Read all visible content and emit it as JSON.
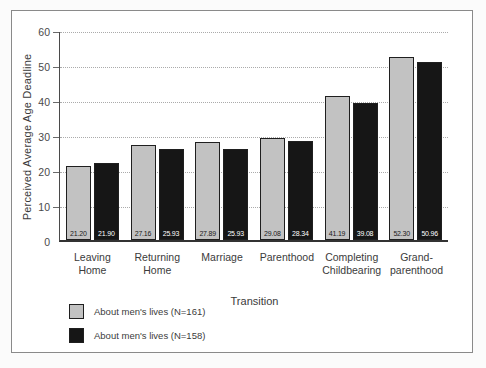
{
  "figure": {
    "background": "#ffffff",
    "outer_background": "#fbfbfb",
    "frame_border_color": "#8a8a8a"
  },
  "chart_data": {
    "type": "bar",
    "title": "",
    "xlabel": "Transition",
    "ylabel": "Perceived Average Age Deadline",
    "ylim": [
      0,
      60
    ],
    "yticks": [
      0,
      10,
      20,
      30,
      40,
      50,
      60
    ],
    "grid": "horizontal-dotted",
    "legend_position": "bottom-left",
    "categories": [
      "Leaving\nHome",
      "Returning\nHome",
      "Marriage",
      "Parenthood",
      "Completing\nChildbearing",
      "Grand-\nparenthood"
    ],
    "series": [
      {
        "name": "About men's lives (N=161)",
        "color": "#c2c2c2",
        "label_color": "#1a1a1a",
        "values": [
          21.2,
          27.16,
          27.89,
          29.08,
          41.19,
          52.3
        ]
      },
      {
        "name": "About men's lives (N=158)",
        "color": "#161616",
        "label_color": "#ffffff",
        "values": [
          21.9,
          25.93,
          25.93,
          28.34,
          39.08,
          50.96
        ]
      }
    ]
  }
}
